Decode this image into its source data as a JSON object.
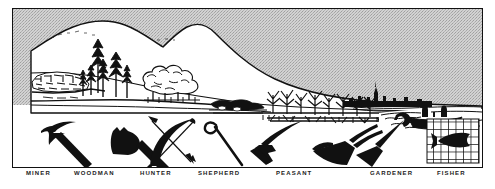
{
  "figure": {
    "kind": "illustration-plate",
    "colors": {
      "ink": "#111111",
      "sky": "#c9c9c9",
      "paper": "#ffffff",
      "caption_text": "#1b1b1b"
    }
  },
  "scene": {
    "name": "landscape-panorama",
    "elements": [
      {
        "id": "sky",
        "label": "sky",
        "note": "stippled grey tone behind mountains"
      },
      {
        "id": "mountain",
        "label": "mountain range",
        "note": "two peaks sloping down to the right"
      },
      {
        "id": "quarry",
        "label": "mine / quarry",
        "note": "rocky cut face at far left"
      },
      {
        "id": "pines",
        "label": "pine woodland",
        "note": "stand of conifers"
      },
      {
        "id": "oaks",
        "label": "deciduous trees",
        "note": "round-canopied trees with fence"
      },
      {
        "id": "pasture",
        "label": "pasture and scrub",
        "note": "low bushes and grazing ground"
      },
      {
        "id": "cornfield",
        "label": "corn field",
        "note": "rows of ripe grain stalks"
      },
      {
        "id": "town",
        "label": "town skyline",
        "note": "distant silhouette with church spire"
      },
      {
        "id": "sea",
        "label": "sea",
        "note": "wavelets at the shoreline"
      },
      {
        "id": "boat",
        "label": "fishing boat",
        "note": "rowing boat with two fishermen"
      }
    ]
  },
  "tools": [
    {
      "id": "pickaxe",
      "icon": "pickaxe-icon",
      "caption": "MINER"
    },
    {
      "id": "axe",
      "icon": "axe-icon",
      "caption": "WOODMAN"
    },
    {
      "id": "bow",
      "icon": "bow-and-arrow-icon",
      "caption": "HUNTER"
    },
    {
      "id": "crook",
      "icon": "shepherds-crook-icon",
      "caption": "SHEPHERD"
    },
    {
      "id": "scythe",
      "icon": "scythe-icon",
      "caption": "PEASANT"
    },
    {
      "id": "plough",
      "icon": "plough-icon",
      "caption": "PEASANT"
    },
    {
      "id": "spade",
      "icon": "spade-icon",
      "caption": "GARDENER"
    },
    {
      "id": "net",
      "icon": "fish-in-net-icon",
      "caption": "FISHER"
    }
  ],
  "captions": [
    "MINER",
    "WOODMAN",
    "HUNTER",
    "SHEPHERD",
    "PEASANT",
    "GARDENER",
    "FISHER"
  ]
}
